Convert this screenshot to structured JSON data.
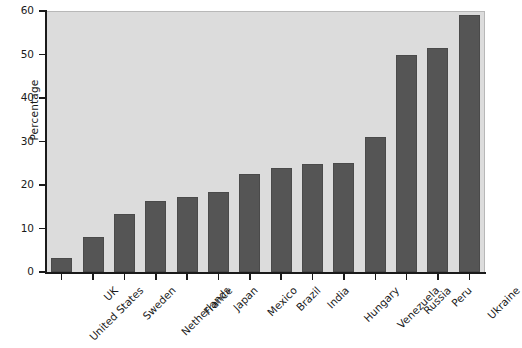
{
  "chart_data": {
    "type": "bar",
    "title": "",
    "xlabel": "",
    "ylabel": "Percentage",
    "ylim": [
      0,
      60
    ],
    "ytick_labels": [
      "0",
      "10",
      "20",
      "30",
      "40",
      "50",
      "60"
    ],
    "ytick_values": [
      0,
      10,
      20,
      30,
      40,
      50,
      60
    ],
    "grid": false,
    "legend": "none",
    "bar_color": "#555555",
    "plot_background": "#dcdcdc",
    "categories": [
      "United States",
      "UK",
      "Sweden",
      "Netherlands",
      "France",
      "Japan",
      "Mexico",
      "Brazil",
      "India",
      "Hungary",
      "Venezuela",
      "Russia",
      "Peru",
      "Ukraine"
    ],
    "values": [
      3.2,
      8.1,
      13.4,
      16.4,
      17.3,
      18.5,
      22.5,
      24.0,
      24.8,
      25.0,
      31.0,
      49.8,
      51.6,
      59.0
    ]
  }
}
